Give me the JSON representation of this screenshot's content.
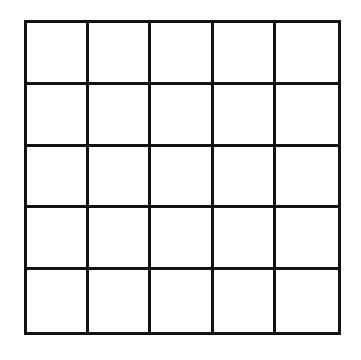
{
  "grid": {
    "rows": 5,
    "cols": 5,
    "line_color": "#111111",
    "background": "#ffffff",
    "cells": [
      [
        "",
        "",
        "",
        "",
        ""
      ],
      [
        "",
        "",
        "",
        "",
        ""
      ],
      [
        "",
        "",
        "",
        "",
        ""
      ],
      [
        "",
        "",
        "",
        "",
        ""
      ],
      [
        "",
        "",
        "",
        "",
        ""
      ]
    ]
  }
}
